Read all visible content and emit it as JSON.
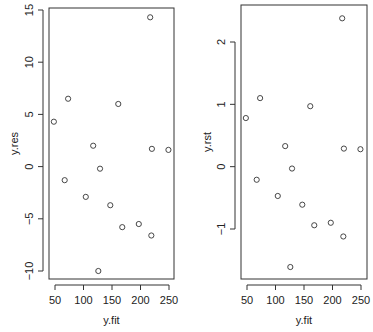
{
  "chart_data": [
    {
      "type": "scatter",
      "title": "",
      "xlabel": "y.fit",
      "ylabel": "y.res",
      "xlim": [
        45,
        255
      ],
      "ylim": [
        -10.5,
        15.5
      ],
      "xticks": [
        50,
        100,
        150,
        200,
        250
      ],
      "yticks": [
        -10,
        -5,
        0,
        5,
        10,
        15
      ],
      "grid": false,
      "marker": "open-circle",
      "points": [
        {
          "x": 48,
          "y": 4.3
        },
        {
          "x": 73,
          "y": 6.5
        },
        {
          "x": 67,
          "y": -1.3
        },
        {
          "x": 104,
          "y": -2.9
        },
        {
          "x": 117,
          "y": 2.0
        },
        {
          "x": 129,
          "y": -0.2
        },
        {
          "x": 147,
          "y": -3.7
        },
        {
          "x": 161,
          "y": 6.0
        },
        {
          "x": 168,
          "y": -5.8
        },
        {
          "x": 197,
          "y": -5.5
        },
        {
          "x": 217,
          "y": 14.3
        },
        {
          "x": 220,
          "y": 1.7
        },
        {
          "x": 219,
          "y": -6.6
        },
        {
          "x": 126,
          "y": -10.0
        },
        {
          "x": 249,
          "y": 1.6
        }
      ]
    },
    {
      "type": "scatter",
      "title": "",
      "xlabel": "y.fit",
      "ylabel": "y.rst",
      "xlim": [
        45,
        255
      ],
      "ylim": [
        -1.75,
        2.6
      ],
      "xticks": [
        50,
        100,
        150,
        200,
        250
      ],
      "yticks": [
        -1,
        0,
        1,
        2
      ],
      "grid": false,
      "marker": "open-circle",
      "points": [
        {
          "x": 48,
          "y": 0.78
        },
        {
          "x": 73,
          "y": 1.1
        },
        {
          "x": 67,
          "y": -0.21
        },
        {
          "x": 104,
          "y": -0.47
        },
        {
          "x": 117,
          "y": 0.33
        },
        {
          "x": 129,
          "y": -0.03
        },
        {
          "x": 147,
          "y": -0.61
        },
        {
          "x": 161,
          "y": 0.97
        },
        {
          "x": 168,
          "y": -0.94
        },
        {
          "x": 197,
          "y": -0.9
        },
        {
          "x": 217,
          "y": 2.38
        },
        {
          "x": 220,
          "y": 0.29
        },
        {
          "x": 219,
          "y": -1.12
        },
        {
          "x": 126,
          "y": -1.61
        },
        {
          "x": 249,
          "y": 0.28
        }
      ]
    }
  ],
  "plots": [
    {
      "xlabel": "y.fit",
      "ylabel": "y.res",
      "xtick_labels": [
        "50",
        "100",
        "150",
        "200",
        "250"
      ],
      "ytick_labels": [
        "-10",
        "-5",
        "0",
        "5",
        "10",
        "15"
      ]
    },
    {
      "xlabel": "y.fit",
      "ylabel": "y.rst",
      "xtick_labels": [
        "50",
        "100",
        "150",
        "200",
        "250"
      ],
      "ytick_labels": [
        "-1",
        "0",
        "1",
        "2"
      ]
    }
  ]
}
